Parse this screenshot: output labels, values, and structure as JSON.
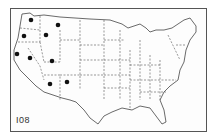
{
  "map": {
    "title": "United States states outline map",
    "figure_number": "I08",
    "marker_color": "#111111",
    "line_color": "#444444",
    "markers": [
      {
        "state": "Washington (north)",
        "x": 31,
        "y": 20
      },
      {
        "state": "Washington/Oregon",
        "x": 24,
        "y": 36
      },
      {
        "state": "Montana",
        "x": 58,
        "y": 25
      },
      {
        "state": "Idaho",
        "x": 46,
        "y": 35
      },
      {
        "state": "California (north)",
        "x": 17,
        "y": 54
      },
      {
        "state": "Nevada",
        "x": 30,
        "y": 58
      },
      {
        "state": "Utah",
        "x": 52,
        "y": 61
      },
      {
        "state": "Arizona",
        "x": 50,
        "y": 84
      },
      {
        "state": "New Mexico",
        "x": 67,
        "y": 82
      }
    ]
  }
}
